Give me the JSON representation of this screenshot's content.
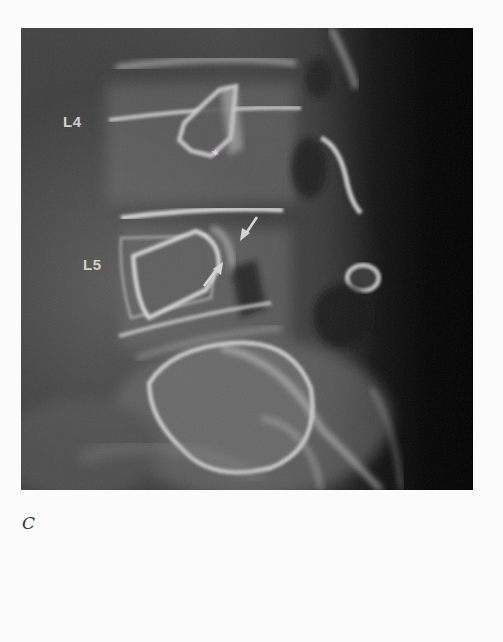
{
  "figure": {
    "panel_letter": "C",
    "image_description": "Lateral lumbar spine radiograph",
    "labels": {
      "l4": "L4",
      "l5": "L5",
      "asterisk": "*"
    },
    "arrows": [
      {
        "name": "upper-arrow",
        "direction": "down-left"
      },
      {
        "name": "lower-arrow",
        "direction": "up-right"
      }
    ],
    "colors": {
      "background": "#fbfbfb",
      "label": "#cfcfcf",
      "bone_highlight": "#d6d6d6",
      "soft_tissue": "#454545",
      "dark_edge": "#030303"
    }
  }
}
